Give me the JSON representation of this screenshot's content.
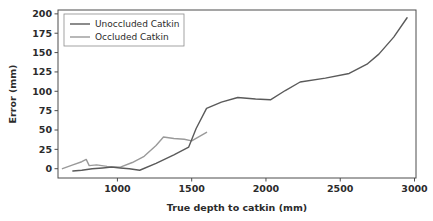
{
  "chart_data": {
    "type": "line",
    "title": "",
    "xlabel": "True depth to catkin (mm)",
    "ylabel": "Error (mm)",
    "xlim": [
      600,
      3010
    ],
    "ylim": [
      -12,
      205
    ],
    "xticks": [
      1000,
      1500,
      2000,
      2500,
      3000
    ],
    "xticklabels": [
      "1000",
      "1500",
      "2000",
      "2500",
      "3000"
    ],
    "yticks": [
      0,
      25,
      50,
      75,
      100,
      125,
      150,
      175,
      200
    ],
    "yticklabels": [
      "0",
      "25",
      "50",
      "75",
      "100",
      "125",
      "150",
      "175",
      "200"
    ],
    "grid": false,
    "legend_position": "upper left",
    "series": [
      {
        "name": "Unoccluded Catkin",
        "color": "#5a5a5a",
        "x": [
          700,
          760,
          830,
          900,
          960,
          1020,
          1080,
          1150,
          1260,
          1380,
          1480,
          1530,
          1600,
          1700,
          1810,
          1930,
          2030,
          2130,
          2230,
          2400,
          2560,
          2680,
          2760,
          2860,
          2950
        ],
        "y": [
          -3,
          -2,
          0,
          1,
          2,
          1,
          0,
          -2,
          7,
          18,
          28,
          52,
          78,
          86,
          92,
          90,
          89,
          101,
          112,
          117,
          123,
          135,
          148,
          170,
          195
        ]
      },
      {
        "name": "Occluded Catkin",
        "color": "#9a9a9a",
        "x": [
          630,
          700,
          760,
          790,
          810,
          860,
          930,
          1020,
          1100,
          1180,
          1260,
          1310,
          1380,
          1450,
          1500,
          1600
        ],
        "y": [
          0,
          5,
          9,
          12,
          4,
          5,
          3,
          2,
          8,
          16,
          30,
          41,
          39,
          38,
          36,
          47
        ]
      }
    ]
  },
  "axes": {
    "spine_color": "#4d4d4d"
  }
}
